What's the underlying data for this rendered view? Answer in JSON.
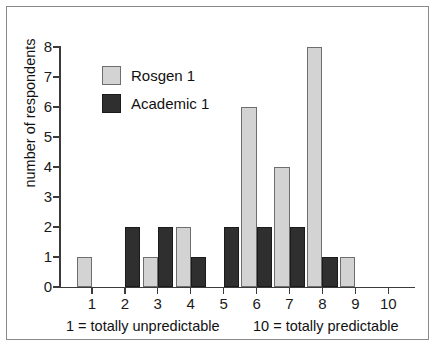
{
  "chart_data": {
    "type": "bar",
    "title": "",
    "subtitle": "",
    "xlabel": "",
    "ylabel": "number of respondents",
    "categories": [
      "1",
      "2",
      "3",
      "4",
      "5",
      "6",
      "7",
      "8",
      "9",
      "10"
    ],
    "series": [
      {
        "name": "Rosgen 1",
        "color": "#d3d3d3",
        "values": [
          1,
          0,
          1,
          2,
          0,
          6,
          4,
          8,
          1,
          0
        ]
      },
      {
        "name": "Academic 1",
        "color": "#2f2f2f",
        "values": [
          0,
          2,
          2,
          1,
          2,
          2,
          2,
          1,
          0,
          0
        ]
      }
    ],
    "ylim": [
      0,
      8
    ],
    "yticks": [
      "0",
      "1",
      "2",
      "3",
      "4",
      "5",
      "6",
      "7",
      "8"
    ],
    "xlim": [
      0.5,
      10.5
    ],
    "grid": false,
    "legend_position": "upper-left-inside",
    "annotations": [
      {
        "text": "1 = totally unpredictable",
        "position": "below-axis-left"
      },
      {
        "text": "10 = totally predictable",
        "position": "below-axis-right"
      }
    ]
  },
  "figure": {
    "axis_color": "#3b3b3b",
    "frame_color": "#8a8a8a",
    "background": "#ffffff"
  }
}
